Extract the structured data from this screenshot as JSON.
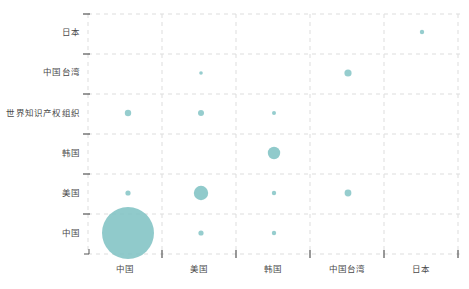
{
  "chart_data": {
    "type": "scatter",
    "title": "",
    "xlabel": "",
    "ylabel": "",
    "legend": null,
    "grid": true,
    "bubble_color": "#7cc1c2",
    "categories_x": [
      "中国",
      "美国",
      "韩国",
      "中国台湾",
      "日本"
    ],
    "categories_y": [
      "中国",
      "美国",
      "韩国",
      "世界知识产权组织",
      "中国台湾",
      "日本"
    ],
    "x_axis": {
      "categories": [
        "中国",
        "美国",
        "韩国",
        "中国台湾",
        "日本"
      ],
      "tick_positions": [
        88,
        162,
        236,
        310,
        384,
        458
      ],
      "label_positions": [
        125,
        199,
        273,
        347,
        421
      ]
    },
    "y_axis": {
      "categories": [
        "日本",
        "中国台湾",
        "世界知识产权组织",
        "韩国",
        "美国",
        "中国"
      ],
      "tick_positions": [
        14,
        54,
        94,
        134,
        174,
        214,
        254
      ],
      "label_positions": [
        32,
        72,
        113,
        153,
        193,
        233
      ]
    },
    "points": [
      {
        "x": "中国",
        "y": "中国",
        "r": 26,
        "cx": 128,
        "cy": 233,
        "value": 100
      },
      {
        "x": "美国",
        "y": "中国",
        "r": 2.6,
        "cx": 201,
        "cy": 233,
        "value": 2
      },
      {
        "x": "韩国",
        "y": "中国",
        "r": 2.2,
        "cx": 274,
        "cy": 233,
        "value": 1
      },
      {
        "x": "中国",
        "y": "美国",
        "r": 2.6,
        "cx": 128,
        "cy": 193,
        "value": 2
      },
      {
        "x": "美国",
        "y": "美国",
        "r": 7.2,
        "cx": 201,
        "cy": 193,
        "value": 12
      },
      {
        "x": "韩国",
        "y": "美国",
        "r": 2.2,
        "cx": 274,
        "cy": 193,
        "value": 1
      },
      {
        "x": "中国台湾",
        "y": "美国",
        "r": 3.4,
        "cx": 348,
        "cy": 193,
        "value": 3
      },
      {
        "x": "韩国",
        "y": "韩国",
        "r": 6.2,
        "cx": 274,
        "cy": 153,
        "value": 9
      },
      {
        "x": "中国",
        "y": "世界知识产权组织",
        "r": 3.2,
        "cx": 128,
        "cy": 113,
        "value": 3
      },
      {
        "x": "美国",
        "y": "世界知识产权组织",
        "r": 3.0,
        "cx": 201,
        "cy": 113,
        "value": 2
      },
      {
        "x": "韩国",
        "y": "世界知识产权组织",
        "r": 2.0,
        "cx": 274,
        "cy": 113,
        "value": 1
      },
      {
        "x": "美国",
        "y": "中国台湾",
        "r": 1.8,
        "cx": 201,
        "cy": 73,
        "value": 1
      },
      {
        "x": "中国台湾",
        "y": "中国台湾",
        "r": 3.6,
        "cx": 348,
        "cy": 73,
        "value": 3
      },
      {
        "x": "日本",
        "y": "日本",
        "r": 2.2,
        "cx": 422,
        "cy": 32,
        "value": 1
      }
    ]
  },
  "style": {
    "grid_color": "#dddddd",
    "axis_color": "#999999",
    "tick_color": "#555555",
    "label_color": "#4a4a4a",
    "background": "#ffffff"
  }
}
